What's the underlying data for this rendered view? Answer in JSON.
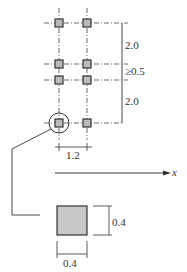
{
  "diagram": {
    "vertical_spacing_top": "2.0",
    "vertical_spacing_middle": "≥0.5",
    "vertical_spacing_bottom": "2.0",
    "horizontal_spacing": "1.2",
    "axis_label": "x",
    "detail_width": "0.4",
    "detail_height": "0.4",
    "colors": {
      "line": "#333333",
      "fill": "#c8c8c8"
    },
    "columns_x": [
      59,
      87
    ],
    "rows_y": [
      23,
      64,
      80,
      123
    ]
  }
}
